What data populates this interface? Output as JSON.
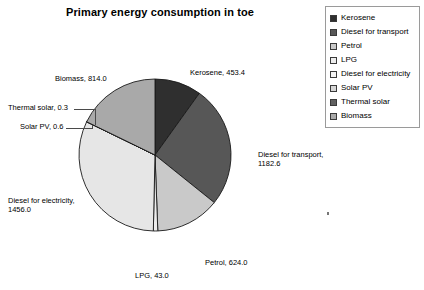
{
  "chart_data": {
    "type": "pie",
    "title": "Primary energy consumption in toe",
    "xlabel": "",
    "ylabel": "",
    "legend_position": "right",
    "grid": false,
    "total": 4573.9,
    "categories": [
      "Kerosene",
      "Diesel for transport",
      "Petrol",
      "LPG",
      "Diesel for electricity",
      "Solar PV",
      "Thermal solar",
      "Biomass"
    ],
    "values": [
      453.4,
      1182.6,
      624.0,
      43.0,
      1456.0,
      0.6,
      0.3,
      814.0
    ],
    "slices": [
      {
        "label": "Kerosene",
        "value": 453.4,
        "value_text": "453.4",
        "data_label": "Kerosene, 453.4",
        "color": "#2f2f2f",
        "start_angle": 0.0,
        "sweep_angle": 35.69
      },
      {
        "label": "Diesel for transport",
        "value": 1182.6,
        "value_text": "1182.6",
        "data_label": "Diesel for transport, 1182.6",
        "color": "#575757",
        "start_angle": 35.69,
        "sweep_angle": 93.08
      },
      {
        "label": "Petrol",
        "value": 624.0,
        "value_text": "624.0",
        "data_label": "Petrol, 624.0",
        "color": "#c9c9c9",
        "start_angle": 128.77,
        "sweep_angle": 49.12
      },
      {
        "label": "LPG",
        "value": 43.0,
        "value_text": "43.0",
        "data_label": "LPG, 43.0",
        "color": "#ededed",
        "start_angle": 177.89,
        "sweep_angle": 3.38
      },
      {
        "label": "Diesel for electricity",
        "value": 1456.0,
        "value_text": "1456.0",
        "data_label": "Diesel for electricity, 1456.0",
        "color": "#e6e6e6",
        "start_angle": 181.27,
        "sweep_angle": 114.6
      },
      {
        "label": "Solar PV",
        "value": 0.6,
        "value_text": "0.6",
        "data_label": "Solar PV, 0.6",
        "color": "#d6d6d6",
        "start_angle": 295.87,
        "sweep_angle": 0.05
      },
      {
        "label": "Thermal solar",
        "value": 0.3,
        "value_text": "0.3",
        "data_label": "Thermal solar, 0.3",
        "color": "#606060",
        "start_angle": 295.92,
        "sweep_angle": 0.02
      },
      {
        "label": "Biomass",
        "value": 814.0,
        "value_text": "814.0",
        "data_label": "Biomass, 814.0",
        "color": "#a9a9a9",
        "start_angle": 295.94,
        "sweep_angle": 64.06
      }
    ]
  },
  "legend": {
    "items": [
      {
        "label": "Kerosene",
        "color": "#2f2f2f"
      },
      {
        "label": "Diesel for transport",
        "color": "#575757"
      },
      {
        "label": "Petrol",
        "color": "#c9c9c9"
      },
      {
        "label": "LPG",
        "color": "#ededed"
      },
      {
        "label": "Diesel for electricity",
        "color": "#f4f4f4"
      },
      {
        "label": "Solar PV",
        "color": "#d6d6d6"
      },
      {
        "label": "Thermal solar",
        "color": "#606060"
      },
      {
        "label": "Biomass",
        "color": "#a9a9a9"
      }
    ]
  },
  "style": {
    "slice_outline": "#1a1a1a",
    "legend_border": "#9a9a9a",
    "text_color": "#000000",
    "background": "#ffffff"
  }
}
